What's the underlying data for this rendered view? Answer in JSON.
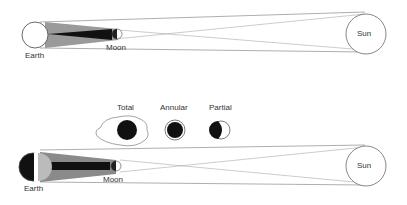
{
  "top_diagram": {
    "title": "Lunar eclipse",
    "labels": {
      "earth": "Earth",
      "moon": "Moon",
      "sun": "Sun"
    }
  },
  "bottom_diagram": {
    "title": "Solar eclipse",
    "labels": {
      "earth": "Earth",
      "moon": "Moon",
      "sun": "Sun"
    }
  },
  "eclipse_types": [
    {
      "label": "Total"
    },
    {
      "label": "Annular"
    },
    {
      "label": "Partial"
    }
  ],
  "colors": {
    "umbra": "#111111",
    "penumbra": "#999999",
    "outline": "#555555"
  }
}
